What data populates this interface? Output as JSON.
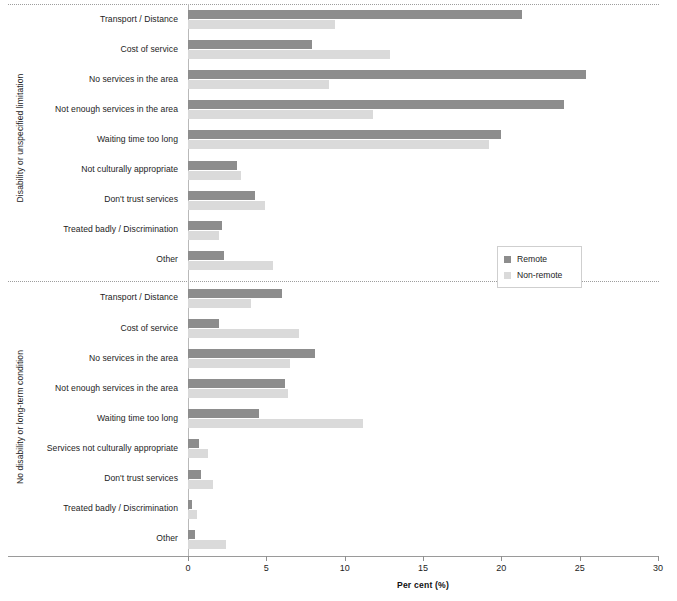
{
  "chart_data": {
    "type": "bar",
    "orientation": "horizontal",
    "title": "",
    "xlabel": "Per cent  (%)",
    "ylabel": "",
    "xlim": [
      0,
      30
    ],
    "xticks": [
      0,
      5,
      10,
      15,
      20,
      25,
      30
    ],
    "xtick_labels": [
      "0",
      "5",
      "10",
      "15",
      "20",
      "25",
      "30"
    ],
    "grid": false,
    "legend_position": "center-right",
    "colors": {
      "remote": "#8d8d8d",
      "non_remote": "#dadada"
    },
    "series": [
      {
        "name": "Remote",
        "key": "remote"
      },
      {
        "name": "Non-remote",
        "key": "non_remote"
      }
    ],
    "groups": [
      {
        "label": "Disability or unspecified limitation",
        "categories": [
          "Transport / Distance",
          "Cost of service",
          "No services in the area",
          "Not enough services in the area",
          "Waiting time too long",
          "Not culturally appropriate",
          "Don't trust services",
          "Treated badly / Discrimination",
          "Other"
        ],
        "remote": [
          21.3,
          7.9,
          25.4,
          24.0,
          20.0,
          3.1,
          4.3,
          2.2,
          2.3
        ],
        "non_remote": [
          9.4,
          12.9,
          9.0,
          11.8,
          19.2,
          3.4,
          4.9,
          2.0,
          5.4
        ]
      },
      {
        "label": "No disability or long-term condition",
        "categories": [
          "Transport / Distance",
          "Cost of service",
          "No services in the area",
          "Not enough services in the area",
          "Waiting time too long",
          "Services not culturally appropriate",
          "Don't trust services",
          "Treated badly / Discrimination",
          "Other"
        ],
        "remote": [
          6.0,
          2.0,
          8.1,
          6.2,
          4.5,
          0.7,
          0.8,
          0.25,
          0.45
        ],
        "non_remote": [
          4.0,
          7.1,
          6.5,
          6.4,
          11.2,
          1.3,
          1.6,
          0.6,
          2.4
        ]
      }
    ]
  },
  "legend": {
    "items": [
      {
        "label": "Remote"
      },
      {
        "label": "Non-remote"
      }
    ]
  },
  "axes": {
    "x_title": "Per cent  (%)",
    "group_labels": [
      "Disability or unspecified limitation",
      "No disability or long-term condition"
    ]
  }
}
